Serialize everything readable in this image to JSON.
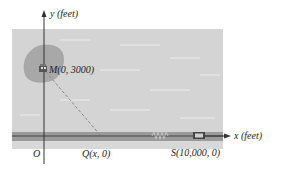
{
  "diagram": {
    "y_axis_label": "y (feet)",
    "x_axis_label": "x (feet)",
    "origin_label": "O",
    "point_M": {
      "name": "M",
      "coords": "(0, 3000)",
      "label": "M(0, 3000)"
    },
    "point_Q": {
      "name": "Q",
      "coords": "(x, 0)",
      "label": "Q(x, 0)"
    },
    "point_S": {
      "name": "S",
      "coords": "(10,000, 0)",
      "label": "S(10,000, 0)"
    },
    "icons": {
      "island": "island-blob",
      "boat_or_house": "boat-icon",
      "car": "car-icon",
      "spring": "spring-zigzag"
    },
    "colors": {
      "water": "#d4d4d4",
      "island": "#a8a8a8",
      "road": "#9a9a9a",
      "axis": "#333333",
      "dashed_path": "#888888"
    }
  }
}
